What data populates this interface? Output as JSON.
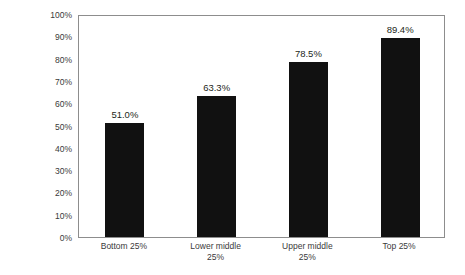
{
  "chart_data": {
    "type": "bar",
    "title": "",
    "xlabel": "",
    "ylabel": "Home ownership rates",
    "categories": [
      "Bottom 25%",
      "Lower middle 25%",
      "Upper middle 25%",
      "Top 25%"
    ],
    "category_lines": [
      [
        "Bottom 25%"
      ],
      [
        "Lower middle",
        "25%"
      ],
      [
        "Upper middle",
        "25%"
      ],
      [
        "Top 25%"
      ]
    ],
    "values": [
      51.0,
      63.3,
      78.5,
      89.4
    ],
    "value_labels": [
      "51.0%",
      "63.3%",
      "78.5%",
      "89.4%"
    ],
    "ylim": [
      0,
      100
    ],
    "ytick_labels": [
      "0%",
      "10%",
      "20%",
      "30%",
      "40%",
      "50%",
      "60%",
      "70%",
      "80%",
      "90%",
      "100%"
    ],
    "ytick_values": [
      0,
      10,
      20,
      30,
      40,
      50,
      60,
      70,
      80,
      90,
      100
    ],
    "grid": false,
    "legend": "none",
    "bar_color": "#111111",
    "axis_color": "#8d8d8d",
    "text_color": "#231f20",
    "background_color": "#ffffff"
  }
}
